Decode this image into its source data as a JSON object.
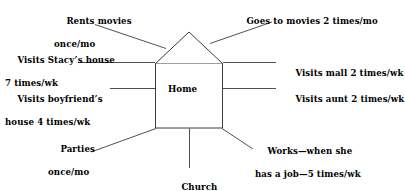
{
  "diagram": {
    "type": "ecomap",
    "center": {
      "shape": "house",
      "label": "Home"
    },
    "stroke_color": "#3a3a3a",
    "text_color": "#000000",
    "background_color": "#ffffff",
    "nodes": [
      {
        "id": "rents-movies",
        "line1": "Rents movies",
        "line2": "once/mo",
        "side": "top-left",
        "connector": "diagonal"
      },
      {
        "id": "goes-to-movies",
        "line1": "Goes to movies 2 times/mo",
        "line2": "",
        "side": "top-right",
        "connector": "diagonal"
      },
      {
        "id": "visits-stacys-house",
        "line1": "Visits Stacy’s house",
        "line2": "7 times/wk",
        "side": "left-upper",
        "connector": "horizontal"
      },
      {
        "id": "visits-mall",
        "line1": "Visits mall 2 times/wk",
        "line2": "",
        "side": "right-upper",
        "connector": "horizontal"
      },
      {
        "id": "visits-boyfriends-house",
        "line1": "Visits boyfriend’s",
        "line2": "house 4 times/wk",
        "side": "left-lower",
        "connector": "horizontal"
      },
      {
        "id": "visits-aunt",
        "line1": "Visits aunt 2 times/wk",
        "line2": "",
        "side": "right-lower",
        "connector": "horizontal"
      },
      {
        "id": "parties",
        "line1": "Parties",
        "line2": "once/mo",
        "side": "bottom-left",
        "connector": "diagonal"
      },
      {
        "id": "works",
        "line1": "Works—when she",
        "line2": "has a job—5 times/wk",
        "side": "bottom-right",
        "connector": "diagonal"
      },
      {
        "id": "church",
        "line1": "Church",
        "line2": "",
        "side": "bottom-center",
        "connector": "vertical"
      }
    ]
  }
}
